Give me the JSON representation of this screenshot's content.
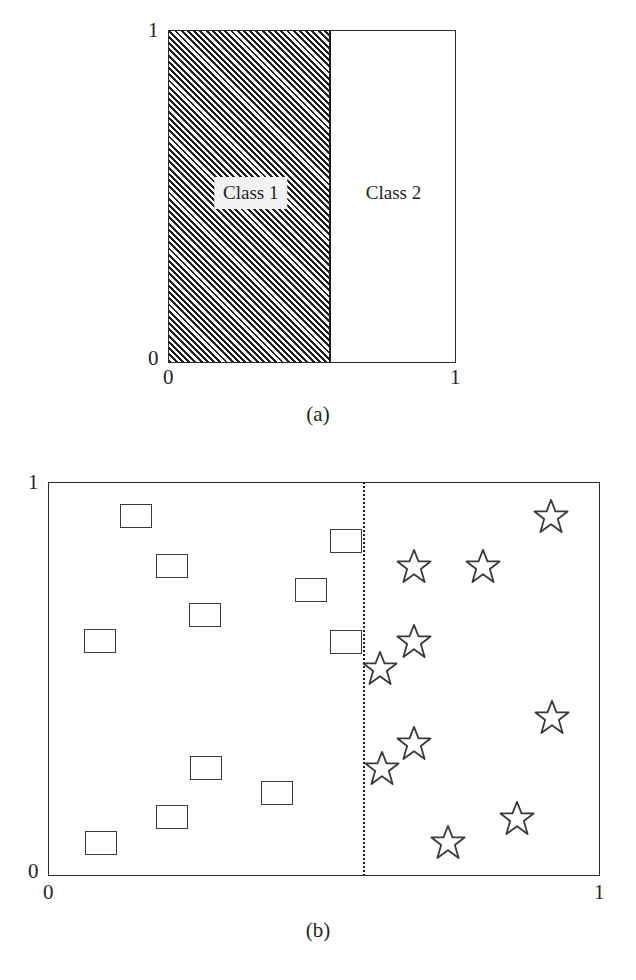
{
  "figure": {
    "panels": [
      {
        "id": "a",
        "caption": "(a)",
        "axis": {
          "y_top_label": "1",
          "y_bottom_label": "0",
          "x_left_label": "0",
          "x_right_label": "1"
        },
        "regions": [
          {
            "name": "Class 1",
            "label": "Class 1",
            "fill": "hatched",
            "x_start": 0.0,
            "x_end": 0.568
          },
          {
            "name": "Class 2",
            "label": "Class 2",
            "fill": "white",
            "x_start": 0.568,
            "x_end": 1.0
          }
        ]
      },
      {
        "id": "b",
        "caption": "(b)",
        "axis": {
          "y_top_label": "1",
          "y_bottom_label": "0",
          "x_left_label": "0",
          "x_right_label": "1"
        },
        "decision_boundary_x": 0.571
      }
    ]
  },
  "colors": {
    "ink": "#231f20",
    "frame": "#2b2b2b",
    "hatch": "#1d1d1d",
    "marker_outline": "#3a3a3a",
    "label_box_fill": "#f2f2f2",
    "background": "#ffffff"
  },
  "chart_data": [
    {
      "type": "area",
      "title": "(a)",
      "xlabel": "",
      "ylabel": "",
      "xlim": [
        0,
        1
      ],
      "ylim": [
        0,
        1
      ],
      "xticks": [
        "0",
        "1"
      ],
      "yticks": [
        "0",
        "1"
      ],
      "grid": false,
      "legend": "none",
      "regions": [
        {
          "label": "Class 1",
          "x_range": [
            0.0,
            0.568
          ],
          "y_range": [
            0.0,
            1.0
          ],
          "fill": "diagonal-hatch"
        },
        {
          "label": "Class 2",
          "x_range": [
            0.568,
            1.0
          ],
          "y_range": [
            0.0,
            1.0
          ],
          "fill": "none"
        }
      ]
    },
    {
      "type": "scatter",
      "title": "(b)",
      "xlabel": "",
      "ylabel": "",
      "xlim": [
        0,
        1
      ],
      "ylim": [
        0,
        1
      ],
      "xticks": [
        "0",
        "1"
      ],
      "yticks": [
        "0",
        "1"
      ],
      "grid": false,
      "legend": "none",
      "annotations": [
        {
          "type": "vline",
          "x": 0.571,
          "style": "dotted",
          "label": "decision boundary"
        }
      ],
      "series": [
        {
          "name": "Class 1",
          "marker": "square",
          "points": [
            [
              0.158,
              0.916
            ],
            [
              0.223,
              0.789
            ],
            [
              0.54,
              0.853
            ],
            [
              0.476,
              0.726
            ],
            [
              0.284,
              0.662
            ],
            [
              0.54,
              0.594
            ],
            [
              0.093,
              0.596
            ],
            [
              0.286,
              0.274
            ],
            [
              0.415,
              0.208
            ],
            [
              0.223,
              0.147
            ],
            [
              0.094,
              0.081
            ]
          ]
        },
        {
          "name": "Class 2",
          "marker": "star",
          "points": [
            [
              0.913,
              0.916
            ],
            [
              0.663,
              0.787
            ],
            [
              0.789,
              0.787
            ],
            [
              0.663,
              0.596
            ],
            [
              0.601,
              0.528
            ],
            [
              0.915,
              0.404
            ],
            [
              0.663,
              0.338
            ],
            [
              0.605,
              0.274
            ],
            [
              0.851,
              0.145
            ],
            [
              0.725,
              0.084
            ]
          ]
        }
      ]
    }
  ]
}
